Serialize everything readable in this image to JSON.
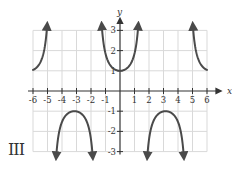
{
  "panel_label": "III",
  "chart_data": {
    "type": "line",
    "title": "",
    "function": "y = sec(x)",
    "xlabel": "x",
    "ylabel": "y",
    "xlim": [
      -6,
      6
    ],
    "ylim": [
      -3,
      3
    ],
    "x_ticks": [
      -6,
      -5,
      -4,
      -3,
      -2,
      -1,
      1,
      2,
      3,
      4,
      5,
      6
    ],
    "x_tick_labels": [
      "-6",
      "-5",
      "-4",
      "-3",
      "-2",
      "-1",
      "1",
      "2",
      "3",
      "4",
      "5",
      "6"
    ],
    "y_ticks": [
      -3,
      -2,
      -1,
      1,
      2,
      3
    ],
    "y_tick_labels": [
      "-3",
      "-2",
      "-1",
      "1",
      "2",
      "3"
    ],
    "grid": true,
    "legend": null,
    "vertical_asymptotes": [
      -4.71,
      -1.57,
      1.57,
      4.71
    ],
    "series": [
      {
        "name": "branch-left-upper",
        "x": [
          -6.0,
          -5.5,
          -5.2,
          -5.0,
          -4.85
        ],
        "y": [
          1.04,
          1.41,
          2.1,
          3.5,
          7.0
        ]
      },
      {
        "name": "branch-left-lower",
        "x": [
          -4.4,
          -4.0,
          -3.5,
          -3.14,
          -2.8,
          -2.3,
          -1.9
        ],
        "y": [
          -3.3,
          -1.53,
          -1.07,
          -1.0,
          -1.06,
          -1.5,
          -3.1
        ]
      },
      {
        "name": "branch-center-upper",
        "x": [
          -1.2,
          -0.8,
          -0.4,
          0,
          0.4,
          0.8,
          1.2
        ],
        "y": [
          2.76,
          1.44,
          1.09,
          1.0,
          1.09,
          1.44,
          2.76
        ]
      },
      {
        "name": "branch-right-lower",
        "x": [
          1.9,
          2.3,
          2.8,
          3.14,
          3.5,
          4.0,
          4.4
        ],
        "y": [
          -3.1,
          -1.5,
          -1.06,
          -1.0,
          -1.07,
          -1.53,
          -3.3
        ]
      },
      {
        "name": "branch-right-upper",
        "x": [
          4.85,
          5.0,
          5.2,
          5.5,
          6.0
        ],
        "y": [
          7.0,
          3.5,
          2.1,
          1.41,
          1.04
        ]
      }
    ],
    "colors": {
      "curve": "#4a4a4a",
      "axis": "#333333",
      "grid": "#d9d9d9"
    }
  }
}
